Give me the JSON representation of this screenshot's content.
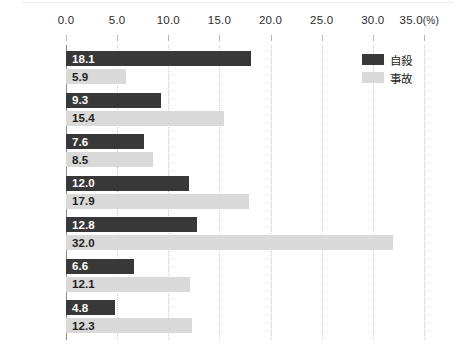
{
  "chart_data": {
    "type": "bar",
    "orientation": "horizontal",
    "title": "",
    "subtitle": "",
    "xlabel": "",
    "ylabel": "",
    "unit_label": "(%)",
    "xlim": [
      0.0,
      35.0
    ],
    "xticks": [
      "0.0",
      "5.0",
      "10.0",
      "15.0",
      "20.0",
      "25.0",
      "30.0",
      "35.0"
    ],
    "xtick_values": [
      0.0,
      5.0,
      10.0,
      15.0,
      20.0,
      25.0,
      30.0,
      35.0
    ],
    "grid": "vertical-dotted",
    "legend_position": "top-right",
    "categories": [
      "日本",
      "フランス",
      "ドイツ",
      "カナダ",
      "アメリカ",
      "イギリス",
      "イタリア"
    ],
    "series": [
      {
        "name": "自殺",
        "color": "#383838",
        "values": [
          18.1,
          9.3,
          7.6,
          12.0,
          12.8,
          6.6,
          4.8
        ],
        "labels": [
          "18.1",
          "9.3",
          "7.6",
          "12.0",
          "12.8",
          "6.6",
          "4.8"
        ]
      },
      {
        "name": "事故",
        "color": "#d9d9d9",
        "values": [
          5.9,
          15.4,
          8.5,
          17.9,
          32.0,
          12.1,
          12.3
        ],
        "labels": [
          "5.9",
          "15.4",
          "8.5",
          "17.9",
          "32.0",
          "12.1",
          "12.3"
        ]
      }
    ]
  },
  "legend": {
    "items": [
      {
        "label": "自殺",
        "color": "#383838"
      },
      {
        "label": "事故",
        "color": "#d9d9d9"
      }
    ]
  },
  "colors": {
    "suicide": "#383838",
    "accident": "#d9d9d9",
    "axis": "#8c8c8c",
    "gridline": "#cfcfcf",
    "text": "#231f20",
    "background": "#ffffff"
  }
}
